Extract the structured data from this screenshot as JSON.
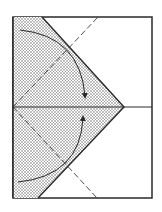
{
  "diagram": {
    "type": "origami-fold-step",
    "colors": {
      "background": "#ffffff",
      "line": "#2a2a2a",
      "dash": "#3a3a3a",
      "shade_dot": "#555555"
    },
    "frame": {
      "x": 13,
      "y": 17,
      "width": 139,
      "height": 181
    },
    "midline_y": 107,
    "flap": {
      "top_x": 42,
      "apex_x": 124,
      "apex_y": 107,
      "bottom_x": 38
    },
    "dashed_lines": [
      {
        "x1": 13,
        "y1": 107,
        "x2": 98,
        "y2": 17
      },
      {
        "x1": 13,
        "y1": 107,
        "x2": 97,
        "y2": 198
      }
    ],
    "arrows": [
      {
        "name": "upper-fold-arrow",
        "path": "M20 30 Q80 36 85 96"
      },
      {
        "name": "lower-fold-arrow",
        "path": "M18 182 Q80 176 83 118"
      }
    ]
  }
}
